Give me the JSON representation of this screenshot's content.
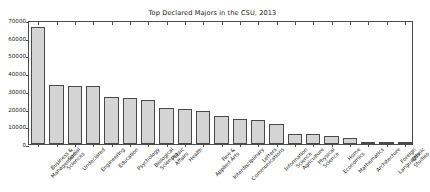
{
  "chart_data": {
    "type": "bar",
    "title": "Top Declared Majors in the CSU, 2013",
    "xlabel": "",
    "ylabel": "",
    "ylim": [
      0,
      70000
    ],
    "yticks": [
      0,
      10000,
      20000,
      30000,
      40000,
      50000,
      60000,
      70000
    ],
    "ytick_labels": [
      "0",
      "10000",
      "20000",
      "30000",
      "40000",
      "50000",
      "60000",
      "70000"
    ],
    "grid": false,
    "legend": null,
    "categories": [
      "Business & Management",
      "Social Sciences",
      "Undeclared",
      "Engineering",
      "Education",
      "Psychology",
      "Biological Sciences",
      "Public Affairs",
      "Health",
      "Fine & Applied Arts",
      "Interdisciplinary",
      "Communications",
      "Letters",
      "Information Science",
      "Agriculture",
      "Physical Science",
      "Home Economics",
      "Mathematics",
      "Architecture",
      "Foreign Languages",
      "Ethnic Studies"
    ],
    "category_lines": [
      [
        "Business &",
        "Management"
      ],
      [
        "Social",
        "Sciences"
      ],
      [
        "Undeclared"
      ],
      [
        "Engineering"
      ],
      [
        "Education"
      ],
      [
        "Psychology"
      ],
      [
        "Biological",
        "Sciences"
      ],
      [
        "Public",
        "Affairs"
      ],
      [
        "Health"
      ],
      [
        "Fine &",
        "Applied Arts"
      ],
      [
        "Interdisciplinary"
      ],
      [
        "Communications"
      ],
      [
        "Letters"
      ],
      [
        "Information",
        "Science"
      ],
      [
        "Agriculture"
      ],
      [
        "Physical",
        "Science"
      ],
      [
        "Home",
        "Economics"
      ],
      [
        "Mathematics"
      ],
      [
        "Architecture"
      ],
      [
        "Foreign",
        "Languages"
      ],
      [
        "Ethnic",
        "Studies"
      ]
    ],
    "values": [
      66300,
      33200,
      32900,
      32600,
      26700,
      25700,
      25100,
      20200,
      20000,
      18500,
      15600,
      14400,
      13800,
      11200,
      5700,
      5500,
      4600,
      3300,
      1000,
      800,
      200
    ],
    "bar_color": "#d4d4d4",
    "bar_edge_color": "#4a4a4a",
    "axes_color": "#4d4d4d",
    "background_color": "#ffffff"
  }
}
